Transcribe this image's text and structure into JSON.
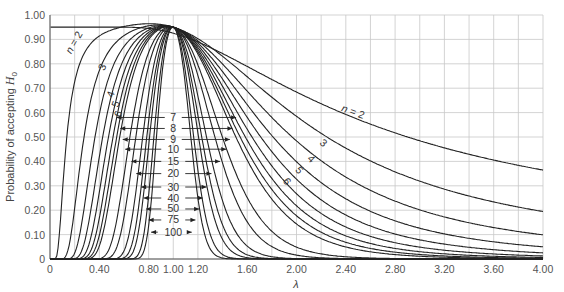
{
  "chart_data": {
    "type": "line",
    "title": "",
    "xlabel": "λ",
    "ylabel": "Probability of accepting H0",
    "xlim": [
      0,
      4.0
    ],
    "ylim": [
      0,
      1.0
    ],
    "grid": true,
    "x_ticks": [
      "0",
      "0.40",
      "0.80",
      "1.00",
      "1.20",
      "1.60",
      "2.00",
      "2.40",
      "2.80",
      "3.20",
      "3.60",
      "4.00"
    ],
    "x_tick_values": [
      0,
      0.4,
      0.8,
      1.0,
      1.2,
      1.6,
      2.0,
      2.4,
      2.8,
      3.2,
      3.6,
      4.0
    ],
    "y_ticks": [
      "0",
      "0.10",
      "0.20",
      "0.30",
      "0.40",
      "0.50",
      "0.60",
      "0.70",
      "0.80",
      "0.90",
      "1.00"
    ],
    "y_tick_values": [
      0,
      0.1,
      0.2,
      0.3,
      0.4,
      0.5,
      0.6,
      0.7,
      0.8,
      0.9,
      1.0
    ],
    "peak": {
      "x": 1.0,
      "y": 0.95
    },
    "series": [
      {
        "name": "n = 2",
        "n": 2,
        "value_at_4": 0.45
      },
      {
        "name": "3",
        "n": 3,
        "value_at_4": 0.2
      },
      {
        "name": "4",
        "n": 4,
        "value_at_4": 0.095
      },
      {
        "name": "5",
        "n": 5,
        "value_at_4": 0.045
      },
      {
        "name": "6",
        "n": 6,
        "value_at_4": 0.02
      },
      {
        "name": "7",
        "n": 7
      },
      {
        "name": "8",
        "n": 8
      },
      {
        "name": "9",
        "n": 9
      },
      {
        "name": "10",
        "n": 10
      },
      {
        "name": "15",
        "n": 15
      },
      {
        "name": "20",
        "n": 20
      },
      {
        "name": "30",
        "n": 30
      },
      {
        "name": "40",
        "n": 40
      },
      {
        "name": "50",
        "n": 50
      },
      {
        "name": "75",
        "n": 75
      },
      {
        "name": "100",
        "n": 100
      }
    ],
    "annotations": {
      "left_labels": [
        {
          "text": "n = 2",
          "x": 0.22,
          "y": 0.88,
          "rot": -60
        },
        {
          "text": "3",
          "x": 0.45,
          "y": 0.78,
          "rot": -65
        },
        {
          "text": "4",
          "x": 0.52,
          "y": 0.67,
          "rot": -70
        },
        {
          "text": "5",
          "x": 0.56,
          "y": 0.63,
          "rot": -70
        },
        {
          "text": "6",
          "x": 0.58,
          "y": 0.59,
          "rot": -70
        }
      ],
      "right_labels": [
        {
          "text": "n = 2",
          "x": 2.45,
          "y": 0.59,
          "rot": 20
        },
        {
          "text": "3",
          "x": 2.2,
          "y": 0.465,
          "rot": 40
        },
        {
          "text": "4",
          "x": 2.1,
          "y": 0.4,
          "rot": 45
        },
        {
          "text": "5",
          "x": 2.0,
          "y": 0.355,
          "rot": 50
        },
        {
          "text": "6",
          "x": 1.9,
          "y": 0.31,
          "rot": 55
        }
      ],
      "center_labels": [
        {
          "text": "7",
          "y": 0.58,
          "xl": 0.54,
          "xr": 1.51
        },
        {
          "text": "8",
          "y": 0.535,
          "xl": 0.57,
          "xr": 1.48
        },
        {
          "text": "9",
          "y": 0.49,
          "xl": 0.59,
          "xr": 1.46
        },
        {
          "text": "10",
          "y": 0.45,
          "xl": 0.61,
          "xr": 1.43
        },
        {
          "text": "15",
          "y": 0.4,
          "xl": 0.66,
          "xr": 1.38
        },
        {
          "text": "20",
          "y": 0.35,
          "xl": 0.7,
          "xr": 1.31
        },
        {
          "text": "30",
          "y": 0.295,
          "xl": 0.74,
          "xr": 1.27
        },
        {
          "text": "40",
          "y": 0.25,
          "xl": 0.76,
          "xr": 1.24
        },
        {
          "text": "50",
          "y": 0.205,
          "xl": 0.78,
          "xr": 1.21
        },
        {
          "text": "75",
          "y": 0.16,
          "xl": 0.8,
          "xr": 1.18
        },
        {
          "text": "100",
          "y": 0.11,
          "xl": 0.82,
          "xr": 1.15
        }
      ]
    }
  }
}
